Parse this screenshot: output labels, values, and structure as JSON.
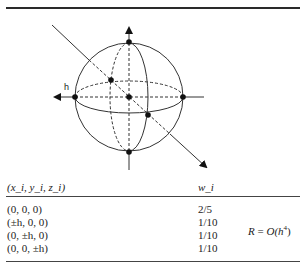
{
  "figure": {
    "axis_label": "h"
  },
  "table": {
    "columns": [
      "(x_i, y_i, z_i)",
      "w_i"
    ],
    "rows": [
      {
        "point": "(0, 0, 0)",
        "weight": "2/5"
      },
      {
        "point": "(±h, 0, 0)",
        "weight": "1/10"
      },
      {
        "point": "(0, ±h, 0)",
        "weight": "1/10"
      },
      {
        "point": "(0, 0, ±h)",
        "weight": "1/10"
      }
    ],
    "remainder": {
      "lhs": "R",
      "equals": " = ",
      "rhs": "O(h",
      "exp": "4",
      "close": ")"
    }
  }
}
